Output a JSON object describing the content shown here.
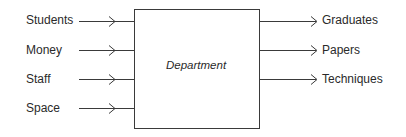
{
  "diagram": {
    "process": {
      "label": "Department"
    },
    "inputs": [
      {
        "label": "Students"
      },
      {
        "label": "Money"
      },
      {
        "label": "Staff"
      },
      {
        "label": "Space"
      }
    ],
    "outputs": [
      {
        "label": "Graduates"
      },
      {
        "label": "Papers"
      },
      {
        "label": "Techniques"
      }
    ],
    "colors": {
      "line": "#3a3a3a",
      "text": "#2a2a2a",
      "background": "#ffffff"
    }
  }
}
